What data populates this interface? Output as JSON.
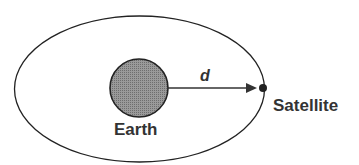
{
  "diagram": {
    "type": "orbit",
    "labels": {
      "earth": "Earth",
      "satellite": "Satellite",
      "distance": "d"
    },
    "colors": {
      "line": "#222222",
      "earth_fill": "#8a8a8a",
      "text": "#333333"
    }
  }
}
